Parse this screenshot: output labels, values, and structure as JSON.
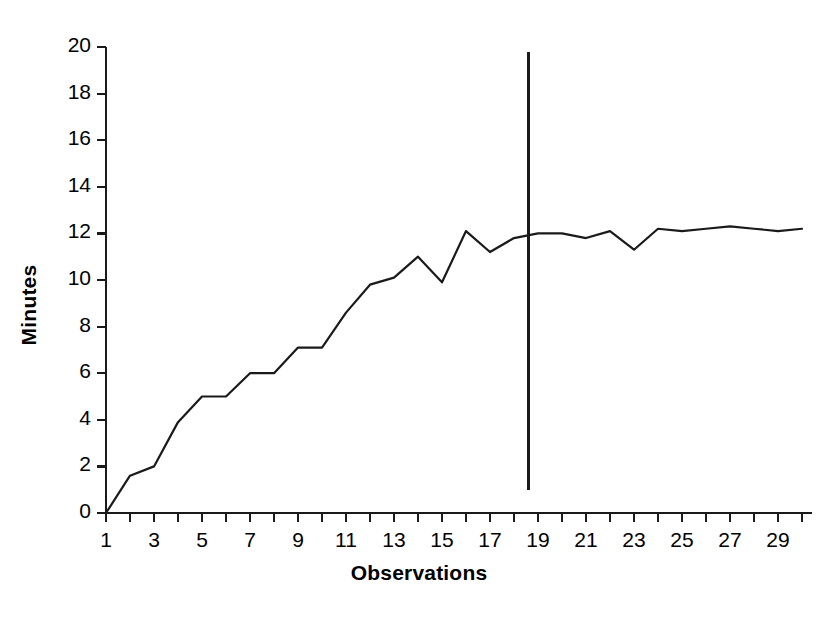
{
  "chart_data": {
    "type": "line",
    "title": "",
    "xlabel": "Observations",
    "ylabel": "Minutes",
    "x": [
      1,
      2,
      3,
      4,
      5,
      6,
      7,
      8,
      9,
      10,
      11,
      12,
      13,
      14,
      15,
      16,
      17,
      18,
      19,
      20,
      21,
      22,
      23,
      24,
      25,
      26,
      27,
      28,
      29,
      30
    ],
    "values": [
      0,
      1.6,
      2.0,
      3.9,
      5.0,
      5.0,
      6.0,
      6.0,
      7.1,
      7.1,
      8.6,
      9.8,
      10.1,
      11.0,
      9.9,
      12.1,
      11.2,
      11.8,
      12.0,
      12.0,
      11.8,
      12.1,
      11.3,
      12.2,
      12.1,
      12.2,
      12.3,
      12.2,
      12.1,
      12.2
    ],
    "series": [
      {
        "name": "Minutes",
        "values": [
          0,
          1.6,
          2.0,
          3.9,
          5.0,
          5.0,
          6.0,
          6.0,
          7.1,
          7.1,
          8.6,
          9.8,
          10.1,
          11.0,
          9.9,
          12.1,
          11.2,
          11.8,
          12.0,
          12.0,
          11.8,
          12.1,
          11.3,
          12.2,
          12.1,
          12.2,
          12.3,
          12.2,
          12.1,
          12.2
        ],
        "color": "#1a1a1a"
      }
    ],
    "xlim": [
      1,
      30
    ],
    "ylim": [
      0,
      20
    ],
    "ytick_values": [
      0,
      2,
      4,
      6,
      8,
      10,
      12,
      14,
      16,
      18,
      20
    ],
    "ytick_labels": [
      "0",
      "2",
      "4",
      "6",
      "8",
      "10",
      "12",
      "14",
      "16",
      "18",
      "20"
    ],
    "xtick_values": [
      1,
      2,
      3,
      4,
      5,
      6,
      7,
      8,
      9,
      10,
      11,
      12,
      13,
      14,
      15,
      16,
      17,
      18,
      19,
      20,
      21,
      22,
      23,
      24,
      25,
      26,
      27,
      28,
      29,
      30
    ],
    "xtick_labels_shown": [
      "1",
      "3",
      "5",
      "7",
      "9",
      "11",
      "13",
      "15",
      "17",
      "19",
      "21",
      "23",
      "25",
      "27",
      "29"
    ],
    "xtick_labeled_values": [
      1,
      3,
      5,
      7,
      9,
      11,
      13,
      15,
      17,
      19,
      21,
      23,
      25,
      27,
      29
    ],
    "grid": false,
    "legend": false,
    "annotations": [
      {
        "name": "vertical-reference-line",
        "type": "vline",
        "x": 18.6,
        "y_from": 1.0,
        "y_to": 19.8,
        "color": "#1a1a1a"
      }
    ],
    "axis_color": "#1a1a1a"
  }
}
